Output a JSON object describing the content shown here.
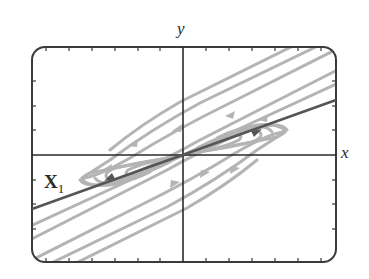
{
  "diagram": {
    "type": "phase-portrait",
    "axes": {
      "x_label": "x",
      "y_label": "y"
    },
    "eigenvector": {
      "label_main": "X",
      "label_sub": "1"
    },
    "colors": {
      "frame": "#3a3a3a",
      "axes": "#2a2a2a",
      "eigenvector_line": "#555555",
      "trajectories": "#b4b4b4",
      "background": "#ffffff"
    }
  }
}
